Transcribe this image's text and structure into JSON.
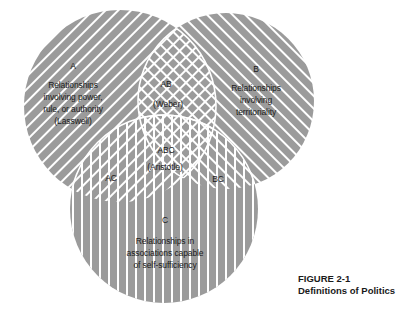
{
  "colors": {
    "fill": "#9b9b9b",
    "stripe": "#ffffff",
    "text": "#1a1a1a"
  },
  "circles": {
    "A": {
      "label": "A",
      "lines": [
        "Relationships",
        "involving power,",
        "rule, or authority",
        "(Lasswell)"
      ],
      "hatch": "diagonal-forward"
    },
    "B": {
      "label": "B",
      "lines": [
        "Relationships",
        "involving",
        "territoriality"
      ],
      "hatch": "diagonal-back"
    },
    "C": {
      "label": "C",
      "lines": [
        "Relationships in",
        "associations capable",
        "of self-sufficiency"
      ],
      "hatch": "vertical"
    }
  },
  "intersections": {
    "AB": {
      "label": "AB",
      "note": "(Weber)"
    },
    "ABC": {
      "label": "ABC",
      "note": "(Aristotle)"
    },
    "AC": {
      "label": "AC"
    },
    "BC": {
      "label": "BC"
    }
  },
  "caption": {
    "figure": "FIGURE  2-1",
    "title": "Definitions of Politics"
  }
}
